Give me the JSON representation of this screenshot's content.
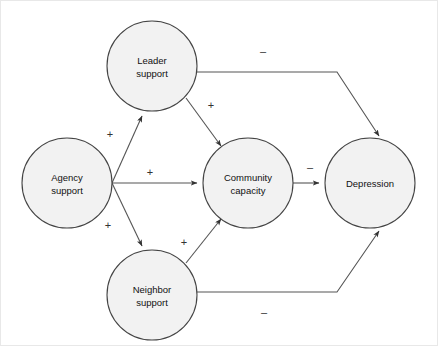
{
  "diagram": {
    "colors": {
      "node_fill": "#f2f2f2",
      "node_stroke": "#444444",
      "edge_stroke": "#555555",
      "background": "#ffffff",
      "frame": "#e8e8e8"
    },
    "nodes": [
      {
        "id": "leader-support",
        "label_line1": "Leader",
        "label_line2": "support",
        "cx": 152,
        "cy": 66,
        "r": 45
      },
      {
        "id": "agency-support",
        "label_line1": "Agency",
        "label_line2": "support",
        "cx": 67,
        "cy": 183,
        "r": 45
      },
      {
        "id": "community-capacity",
        "label_line1": "Community",
        "label_line2": "capacity",
        "cx": 248,
        "cy": 183,
        "r": 45
      },
      {
        "id": "neighbor-support",
        "label_line1": "Neighbor",
        "label_line2": "support",
        "cx": 152,
        "cy": 295,
        "r": 45
      },
      {
        "id": "depression",
        "label_line1": "Depression",
        "label_line2": "",
        "cx": 370,
        "cy": 183,
        "r": 45
      }
    ],
    "edges": [
      {
        "id": "agency-to-leader",
        "from": "agency-support",
        "to": "leader-support",
        "sign": "+",
        "sign_x": 110,
        "sign_y": 135
      },
      {
        "id": "agency-to-community",
        "from": "agency-support",
        "to": "community-capacity",
        "sign": "+",
        "sign_x": 150,
        "sign_y": 173
      },
      {
        "id": "agency-to-neighbor",
        "from": "agency-support",
        "to": "neighbor-support",
        "sign": "+",
        "sign_x": 108,
        "sign_y": 226
      },
      {
        "id": "leader-to-community",
        "from": "leader-support",
        "to": "community-capacity",
        "sign": "+",
        "sign_x": 211,
        "sign_y": 106
      },
      {
        "id": "neighbor-to-community",
        "from": "neighbor-support",
        "to": "community-capacity",
        "sign": "+",
        "sign_x": 184,
        "sign_y": 243
      },
      {
        "id": "community-to-depression",
        "from": "community-capacity",
        "to": "depression",
        "sign": "–",
        "sign_x": 310,
        "sign_y": 168
      },
      {
        "id": "leader-to-depression",
        "from": "leader-support",
        "to": "depression",
        "sign": "–",
        "sign_x": 263,
        "sign_y": 52
      },
      {
        "id": "neighbor-to-depression",
        "from": "neighbor-support",
        "to": "depression",
        "sign": "–",
        "sign_x": 264,
        "sign_y": 313
      }
    ]
  }
}
